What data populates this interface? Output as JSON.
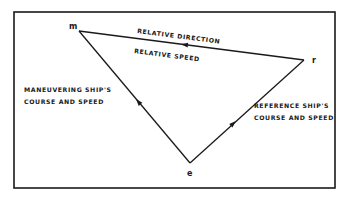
{
  "diagram": {
    "type": "relative-motion vector triangle",
    "colors": {
      "background": "#ffffff",
      "ink": "#1a1a1a"
    },
    "frame": {
      "x": 14,
      "y": 12,
      "width": 321,
      "height": 176
    },
    "vertices": {
      "m": {
        "label": "m",
        "x": 79,
        "y": 31
      },
      "r": {
        "label": "r",
        "x": 304,
        "y": 60
      },
      "e": {
        "label": "e",
        "x": 190,
        "y": 163
      }
    },
    "vectors": [
      {
        "name": "relative-motion",
        "from": "r",
        "to": "m",
        "arrow_direction": "toward m"
      },
      {
        "name": "maneuvering-ship",
        "from": "e",
        "to": "m",
        "arrow_direction": "toward m"
      },
      {
        "name": "reference-ship",
        "from": "e",
        "to": "r",
        "arrow_direction": "toward r"
      }
    ],
    "labels": {
      "relative_direction": "RELATIVE DIRECTION",
      "relative_speed": "RELATIVE SPEED",
      "maneuvering_line1": "MANEUVERING SHIP'S",
      "maneuvering_line2": "COURSE AND SPEED",
      "reference_line1": "REFERENCE SHIP'S",
      "reference_line2": "COURSE AND SPEED"
    }
  }
}
